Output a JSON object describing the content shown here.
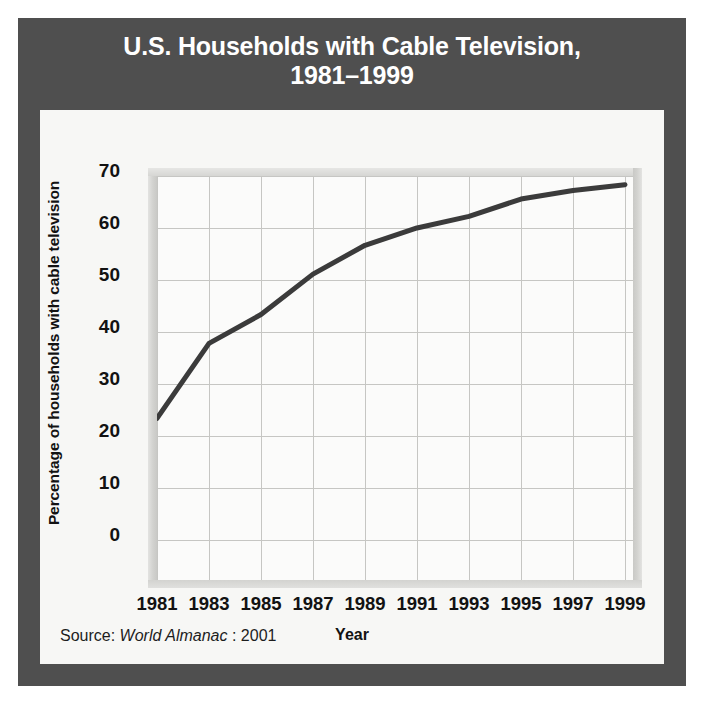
{
  "figure": {
    "title": "U.S. Households with Cable Television,\n1981–1999",
    "source_prefix": "Source:",
    "source_italic": "World Almanac",
    "source_suffix": ": 2001"
  },
  "chart_data": {
    "type": "line",
    "title": "U.S. Households with Cable Television, 1981–1999",
    "xlabel": "Year",
    "ylabel": "Percentage of households with cable television",
    "x": [
      1981,
      1983,
      1985,
      1987,
      1989,
      1991,
      1993,
      1995,
      1997,
      1999
    ],
    "values": [
      28,
      41,
      46,
      53,
      58,
      61,
      63,
      66,
      67.5,
      68.5
    ],
    "series": [
      {
        "name": "Percentage of households with cable television",
        "values": [
          28,
          41,
          46,
          53,
          58,
          61,
          63,
          66,
          67.5,
          68.5
        ]
      }
    ],
    "xtick_labels": [
      "1981",
      "1983",
      "1985",
      "1987",
      "1989",
      "1991",
      "1993",
      "1995",
      "1997",
      "1999"
    ],
    "ytick_labels": [
      "70",
      "60",
      "50",
      "40",
      "30",
      "20",
      "10",
      "0"
    ],
    "yticks": [
      70,
      60,
      50,
      40,
      30,
      20,
      10,
      0
    ],
    "ylim": [
      -8,
      70
    ],
    "xlim": [
      1980,
      2000
    ],
    "grid": true,
    "legend": "none",
    "line_color": "#3b3b3b",
    "line_width": 5
  },
  "colors": {
    "frame": "#4f4f4f",
    "title_text": "#ffffff",
    "panel": "#f7f7f5",
    "plot_bg": "#fbfbfa",
    "gridline": "#c6c6c3",
    "series": "#3b3b3b",
    "text": "#121212"
  }
}
